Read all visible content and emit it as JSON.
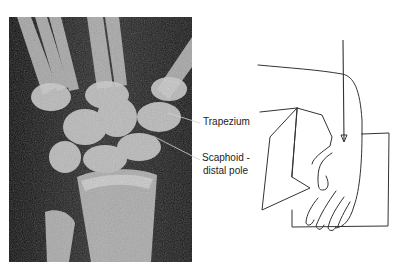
{
  "figure": {
    "left_panel": {
      "type": "radiograph",
      "subject": "wrist x-ray (PA view)",
      "labels": [
        {
          "text": "Trapezium"
        },
        {
          "text": "Scaphoid -"
        },
        {
          "text": "distal pole"
        }
      ]
    },
    "right_panel": {
      "type": "line drawing",
      "subject": "hand resting on block with downward arrow indicating beam direction"
    }
  }
}
